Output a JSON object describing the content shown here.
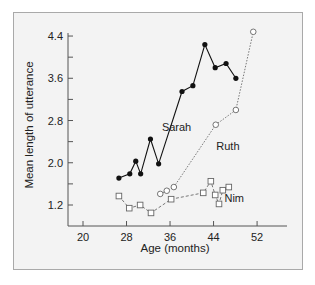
{
  "chart_data": {
    "type": "line",
    "title": "",
    "xlabel": "Age (months)",
    "ylabel": "Mean length of utterance",
    "xlim": [
      17,
      55
    ],
    "ylim": [
      0.8,
      4.5
    ],
    "xticks": [
      20,
      28,
      36,
      44,
      52
    ],
    "yticks": [
      1.2,
      2.0,
      2.8,
      3.6,
      4.4
    ],
    "xtick_labels": [
      "20",
      "28",
      "36",
      "44",
      "52"
    ],
    "ytick_labels": [
      "1.2",
      "2.0",
      "2.8",
      "3.6",
      "4.4"
    ],
    "grid": false,
    "legend": "inline labels",
    "series": [
      {
        "name": "Sarah",
        "marker": "filled-circle",
        "line": "solid",
        "x": [
          26.6,
          28.6,
          29.7,
          30.6,
          32.4,
          33.9,
          38.2,
          40.2,
          42.4,
          44.3,
          46.3,
          48.1
        ],
        "values": [
          1.71,
          1.79,
          2.03,
          1.79,
          2.45,
          1.98,
          3.35,
          3.46,
          4.24,
          3.8,
          3.88,
          3.6
        ]
      },
      {
        "name": "Ruth",
        "marker": "open-circle",
        "line": "dotted",
        "x": [
          34.2,
          35.4,
          36.7,
          44.4,
          48.1,
          51.3
        ],
        "values": [
          1.41,
          1.47,
          1.54,
          2.72,
          3.0,
          4.48
        ]
      },
      {
        "name": "Nim",
        "marker": "open-square",
        "line": "dashed",
        "x": [
          26.6,
          28.5,
          30.5,
          32.5,
          36.2,
          42.1,
          43.5,
          44.3,
          45.0,
          45.7,
          46.8
        ],
        "values": [
          1.37,
          1.14,
          1.2,
          1.05,
          1.31,
          1.43,
          1.65,
          1.39,
          1.22,
          1.48,
          1.54
        ]
      }
    ],
    "annotations": [
      {
        "text": "Sarah",
        "x": 34.5,
        "y": 2.6
      },
      {
        "text": "Ruth",
        "x": 44.5,
        "y": 2.25
      },
      {
        "text": "Nim",
        "x": 46,
        "y": 1.25
      }
    ]
  },
  "colors": {
    "background": "#f3f3f3",
    "frame_border": "#a9a9a9",
    "axis": "#555555",
    "sarah": "#111111",
    "ruth": "#777777",
    "nim": "#777777"
  }
}
